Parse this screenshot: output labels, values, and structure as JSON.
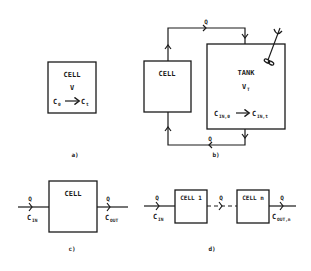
{
  "colors": {
    "ink": "#1a1a1a",
    "background": "#ffffff"
  },
  "panel_a": {
    "caption": "a)",
    "cell": {
      "title": "CELL",
      "volume": "V",
      "conc_start": "C",
      "conc_start_sub": "0",
      "conc_end": "C",
      "conc_end_sub": "t"
    }
  },
  "panel_b": {
    "caption": "b)",
    "flow_top": "Q",
    "flow_bottom": "Q",
    "cell": {
      "title": "CELL"
    },
    "tank": {
      "title": "TANK",
      "volume": "V",
      "volume_sub": "T",
      "conc_start": "C",
      "conc_start_sub": "IN,0",
      "conc_end": "C",
      "conc_end_sub": "IN,t"
    },
    "stirrer_icon": "stirrer-icon"
  },
  "panel_c": {
    "caption": "c)",
    "cell": {
      "title": "CELL"
    },
    "inlet": {
      "flow": "Q",
      "conc": "C",
      "conc_sub": "IN"
    },
    "outlet": {
      "flow": "Q",
      "conc": "C",
      "conc_sub": "OUT"
    }
  },
  "panel_d": {
    "caption": "d)",
    "cells": [
      {
        "title": "CELL 1"
      },
      {
        "title": "CELL n"
      }
    ],
    "inlet": {
      "flow": "Q",
      "conc": "C",
      "conc_sub": "IN"
    },
    "between": {
      "flow": "Q"
    },
    "outlet": {
      "flow": "Q",
      "conc": "C",
      "conc_sub": "OUT,n"
    }
  }
}
